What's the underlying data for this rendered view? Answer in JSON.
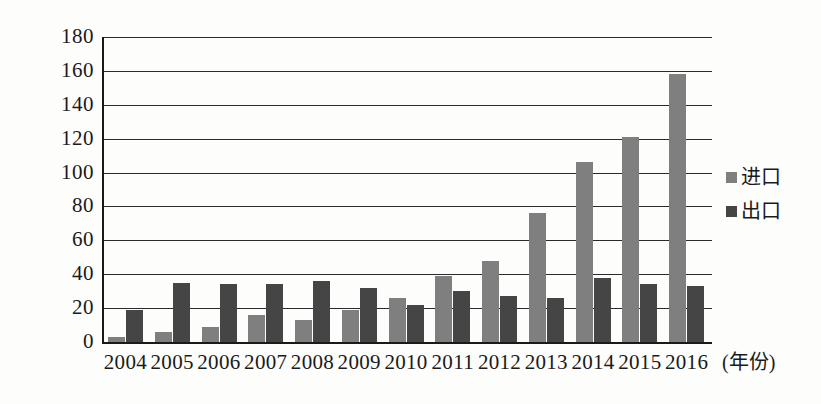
{
  "chart_data": {
    "type": "bar",
    "title": "",
    "subtitle": "",
    "xlabel": "(年份)",
    "ylabel": "",
    "categories": [
      "2004",
      "2005",
      "2006",
      "2007",
      "2008",
      "2009",
      "2010",
      "2011",
      "2012",
      "2013",
      "2014",
      "2015",
      "2016"
    ],
    "series": [
      {
        "name": "进口",
        "color": "#7f7f7f",
        "values": [
          3,
          6,
          9,
          16,
          13,
          19,
          26,
          39,
          48,
          76,
          106,
          121,
          158
        ]
      },
      {
        "name": "出口",
        "color": "#454545",
        "values": [
          19,
          35,
          34,
          34,
          36,
          32,
          22,
          30,
          27,
          26,
          38,
          34,
          33
        ]
      }
    ],
    "ylim": [
      0,
      180
    ],
    "yticks": [
      0,
      20,
      40,
      60,
      80,
      100,
      120,
      140,
      160,
      180
    ],
    "ytick_labels": [
      "0",
      "20",
      "40",
      "60",
      "80",
      "100",
      "120",
      "140",
      "160",
      "180"
    ],
    "grid": true,
    "grid_axis": "y",
    "legend_position": "right"
  },
  "legend": {
    "items": [
      {
        "label": "进口",
        "swatch": "import-swatch-icon"
      },
      {
        "label": "出口",
        "swatch": "export-swatch-icon"
      }
    ]
  },
  "axis": {
    "x_title": "(年份)"
  }
}
